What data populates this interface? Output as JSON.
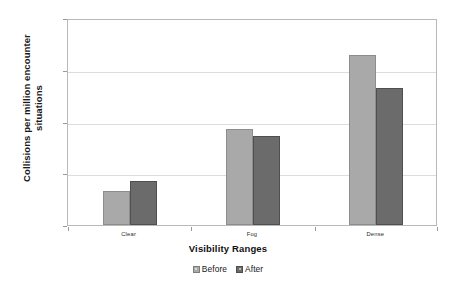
{
  "chart_data": {
    "type": "bar",
    "title": "",
    "subtitle": "",
    "xlabel": "Visibility Ranges",
    "ylabel": "Collisions per million encounter situations",
    "categories": [
      "Clear",
      "Fog",
      "Dense"
    ],
    "series": [
      {
        "name": "Before",
        "values": [
          4.5,
          73,
          1900
        ],
        "color": "#a9a9a9"
      },
      {
        "name": "After",
        "values": [
          7,
          52,
          450
        ],
        "color": "#6b6b6b"
      }
    ],
    "yscale": "log",
    "ylim": [
      1,
      10000
    ],
    "yticks": [
      "1",
      "10",
      "100",
      "1000",
      "10000"
    ],
    "grid": true,
    "legend_position": "bottom",
    "legend_entries": [
      "Before",
      "After"
    ],
    "annotations": []
  },
  "axes": {
    "y_title": "Collisions per million encounter situations",
    "x_title": "Visibility Ranges"
  },
  "legend": {
    "items": [
      {
        "label": "Before",
        "swatch": "legend-swatch-before"
      },
      {
        "label": "After",
        "swatch": "legend-swatch-after"
      }
    ]
  }
}
